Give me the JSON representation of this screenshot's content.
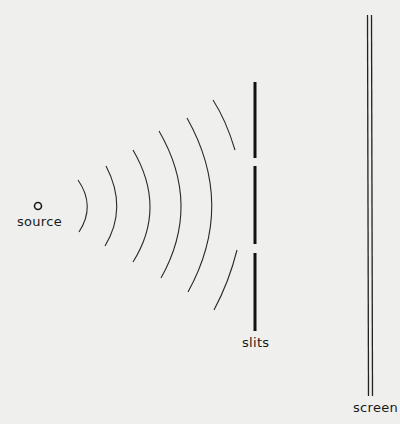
{
  "diagram": {
    "labels": {
      "source": "source",
      "slits": "slits",
      "screen": "screen"
    },
    "colors": {
      "background": "#efefed",
      "ink": "#1a1a1a"
    },
    "wavefront_count": 6
  }
}
